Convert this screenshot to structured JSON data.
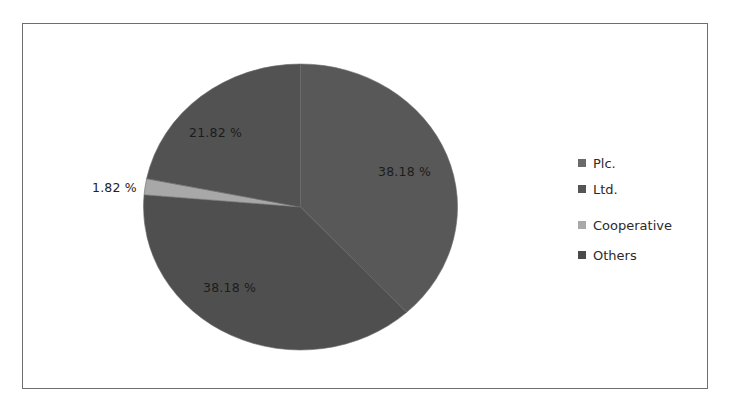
{
  "chart_data": {
    "type": "pie",
    "title": "",
    "categories": [
      "Plc.",
      "Ltd.",
      "Cooperative",
      "Others"
    ],
    "values": [
      38.18,
      38.18,
      1.82,
      21.82
    ],
    "value_labels": [
      "38.18 %",
      "38.18 %",
      "1.82 %",
      "21.82 %"
    ],
    "unit": "%",
    "start_angle_deg": 0,
    "direction": "clockwise",
    "colors": [
      "#585858",
      "#4f4f4f",
      "#a8a8a8",
      "#525252"
    ],
    "legend": {
      "position": "right",
      "entries": [
        "Plc.",
        "Ltd.",
        "Cooperative",
        "Others"
      ],
      "swatch_colors": [
        "#6a6a6a",
        "#555555",
        "#a9a9a9",
        "#4a4a4a"
      ]
    },
    "grid": false
  },
  "labels": {
    "plc": "38.18 %",
    "ltd": "38.18 %",
    "cooperative": "1.82 %",
    "others": "21.82 %"
  },
  "legend": {
    "items": [
      {
        "label": "Plc.",
        "color": "#6a6a6a"
      },
      {
        "label": "Ltd.",
        "color": "#555555"
      },
      {
        "label": "Cooperative",
        "color": "#a9a9a9"
      },
      {
        "label": "Others",
        "color": "#4a4a4a"
      }
    ]
  }
}
